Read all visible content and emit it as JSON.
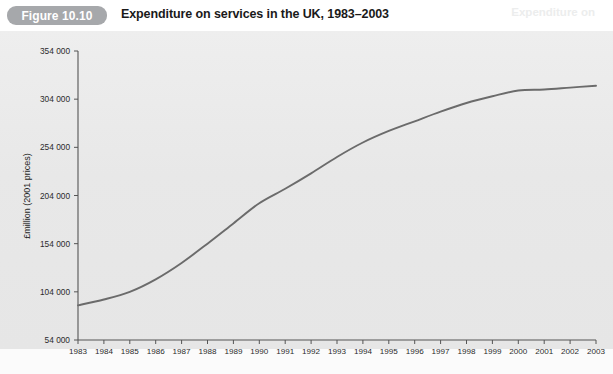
{
  "figure": {
    "badge": "Figure 10.10",
    "title": "Expenditure on services in the UK, 1983–2003",
    "ghost_text": "Expenditure on"
  },
  "chart_data": {
    "type": "line",
    "title": "Expenditure on services in the UK, 1983–2003",
    "xlabel": "",
    "ylabel": "£million (2001 prices)",
    "x": [
      1983,
      1984,
      1985,
      1986,
      1987,
      1988,
      1989,
      1990,
      1991,
      1992,
      1993,
      1994,
      1995,
      1996,
      1997,
      1998,
      1999,
      2000,
      2001,
      2002,
      2003
    ],
    "categories": [
      "1983",
      "1984",
      "1985",
      "1986",
      "1987",
      "1988",
      "1989",
      "1990",
      "1991",
      "1992",
      "1993",
      "1994",
      "1995",
      "1996",
      "1997",
      "1998",
      "1999",
      "2000",
      "2001",
      "2002",
      "2003"
    ],
    "values": [
      90000,
      96000,
      104000,
      117000,
      134000,
      154000,
      175000,
      196000,
      211000,
      227000,
      244000,
      259000,
      271000,
      281000,
      291000,
      300000,
      307000,
      313000,
      314000,
      316000,
      318000
    ],
    "series": [
      {
        "name": "Expenditure on services",
        "values": [
          90000,
          96000,
          104000,
          117000,
          134000,
          154000,
          175000,
          196000,
          211000,
          227000,
          244000,
          259000,
          271000,
          281000,
          291000,
          300000,
          307000,
          313000,
          314000,
          316000,
          318000
        ],
        "color": "#6b6b6b"
      }
    ],
    "ylim": [
      54000,
      354000
    ],
    "yticks": [
      54000,
      104000,
      154000,
      204000,
      254000,
      304000,
      354000
    ],
    "ytick_labels": [
      "54 000",
      "104 000",
      "154 000",
      "204 000",
      "254 000",
      "304 000",
      "354 000"
    ],
    "xlim": [
      1983,
      2003
    ],
    "grid": false,
    "legend": "none",
    "line_color": "#6b6b6b",
    "plot_background": "#ebebeb"
  }
}
